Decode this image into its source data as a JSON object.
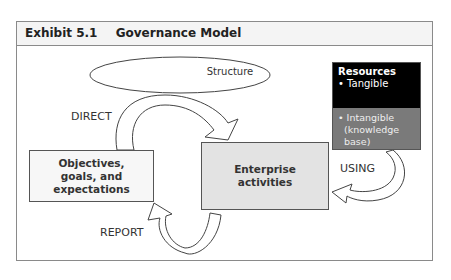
{
  "exhibit": {
    "number": "Exhibit 5.1",
    "title": "Governance Model"
  },
  "nodes": {
    "structure": "Structure",
    "objectives": [
      "Objectives,",
      "goals, and",
      "expectations"
    ],
    "enterprise": [
      "Enterprise",
      "activities"
    ],
    "resources": {
      "title": "Resources",
      "tangible": "• Tangible",
      "intangible": "• Intangible",
      "intangible_note": "(knowledge base)"
    }
  },
  "flows": {
    "direct": "DIRECT",
    "using": "USING",
    "report": "REPORT"
  },
  "colors": {
    "resources_top": "#000000",
    "resources_bottom": "#7a7a7a",
    "enterprise_fill": "#e3e3e3",
    "objectives_fill": "#f7f7f7"
  }
}
